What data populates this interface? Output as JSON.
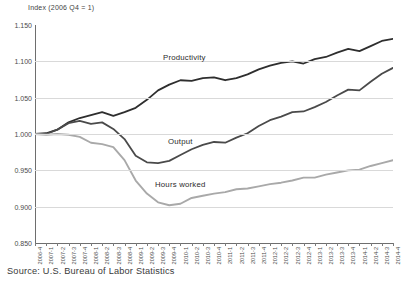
{
  "chart_data": {
    "type": "line",
    "title": "Index (2006 Q4 = 1)",
    "ylabel": "Index (2006 Q4 = 1)",
    "xlabel": "",
    "ylim": [
      0.85,
      1.15
    ],
    "ytick_labels": [
      "1.150",
      "1.100",
      "1.050",
      "1.000",
      "0.950",
      "0.900",
      "0.850"
    ],
    "ytick_values": [
      1.15,
      1.1,
      1.05,
      1.0,
      0.95,
      0.9,
      0.85
    ],
    "grid": true,
    "legend_position": "inline-annotations",
    "source": "Source: U.S. Bureau of Labor Statistics",
    "categories": [
      "2006-4",
      "2007-1",
      "2007-2",
      "2007-3",
      "2007-4",
      "2008-1",
      "2008-2",
      "2008-3",
      "2008-4",
      "2009-1",
      "2009-2",
      "2009-3",
      "2009-4",
      "2010-1",
      "2010-2",
      "2010-3",
      "2010-4",
      "2011-1",
      "2011-2",
      "2011-3",
      "2011-4",
      "2012-1",
      "2012-2",
      "2012-3",
      "2012-4",
      "2013-1",
      "2013-2",
      "2013-3",
      "2013-4",
      "2014-1",
      "2014-2",
      "2014-3",
      "2014-4"
    ],
    "series": [
      {
        "name": "Productivity",
        "color": "#2e2e2e",
        "values": [
          1.0,
          1.001,
          1.006,
          1.016,
          1.022,
          1.026,
          1.03,
          1.025,
          1.03,
          1.036,
          1.047,
          1.06,
          1.068,
          1.074,
          1.073,
          1.077,
          1.078,
          1.074,
          1.077,
          1.082,
          1.089,
          1.094,
          1.098,
          1.1,
          1.097,
          1.103,
          1.106,
          1.112,
          1.117,
          1.114,
          1.121,
          1.128,
          1.131
        ]
      },
      {
        "name": "Output",
        "color": "#4a4a4a",
        "values": [
          1.0,
          1.0,
          1.006,
          1.015,
          1.018,
          1.014,
          1.016,
          1.007,
          0.993,
          0.97,
          0.961,
          0.96,
          0.963,
          0.971,
          0.979,
          0.985,
          0.989,
          0.988,
          0.995,
          1.001,
          1.011,
          1.019,
          1.024,
          1.03,
          1.031,
          1.037,
          1.044,
          1.053,
          1.061,
          1.06,
          1.072,
          1.083,
          1.091
        ]
      },
      {
        "name": "Hours worked",
        "color": "#a9a9a9",
        "values": [
          1.0,
          0.999,
          1.0,
          0.999,
          0.996,
          0.988,
          0.986,
          0.982,
          0.964,
          0.936,
          0.918,
          0.906,
          0.902,
          0.904,
          0.912,
          0.915,
          0.918,
          0.92,
          0.924,
          0.925,
          0.928,
          0.931,
          0.933,
          0.936,
          0.94,
          0.94,
          0.944,
          0.947,
          0.95,
          0.951,
          0.956,
          0.96,
          0.964
        ]
      }
    ]
  },
  "labels": {
    "productivity": "Productivity",
    "output": "Output",
    "hours": "Hours worked"
  },
  "source_note": "Source: U.S. Bureau of Labor Statistics"
}
